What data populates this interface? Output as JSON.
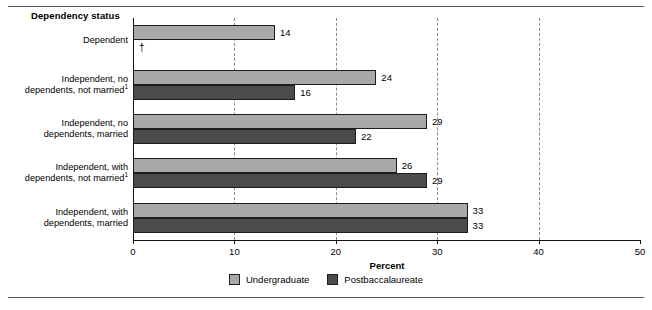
{
  "figure": {
    "group_title": "Dependency status",
    "legend": [
      {
        "label": "Undergraduate",
        "color": "#a8a8a8",
        "key": "undergraduate"
      },
      {
        "label": "Postbaccalaureate",
        "color": "#4b4b4b",
        "key": "postbaccalaureate"
      }
    ],
    "suppressed_symbol": "†"
  },
  "chart_data": {
    "type": "bar",
    "orientation": "horizontal",
    "title": "Dependency status",
    "xlabel": "Percent",
    "ylabel": "",
    "xlim": [
      0,
      50
    ],
    "xticks": [
      0,
      10,
      20,
      30,
      40,
      50
    ],
    "xticklabels": [
      "0",
      "10",
      "20",
      "30",
      "40",
      "50"
    ],
    "grid": "vertical-dashed",
    "legend_position": "bottom-center",
    "categories": [
      "Dependent",
      "Independent, no dependents, not married¹",
      "Independent, no dependents, married",
      "Independent, with dependents, not married¹",
      "Independent, with dependents, married"
    ],
    "category_lines": [
      [
        "Dependent"
      ],
      [
        "Independent, no",
        "dependents, not married"
      ],
      [
        "Independent, no",
        "dependents, married"
      ],
      [
        "Independent, with",
        "dependents, not married"
      ],
      [
        "Independent, with",
        "dependents, married"
      ]
    ],
    "category_footnote_marks": [
      "",
      "1",
      "",
      "1",
      ""
    ],
    "series": [
      {
        "name": "Undergraduate",
        "color": "#a8a8a8",
        "values": [
          14,
          24,
          29,
          26,
          33
        ],
        "labels": [
          "14",
          "24",
          "29",
          "26",
          "33"
        ]
      },
      {
        "name": "Postbaccalaureate",
        "color": "#4b4b4b",
        "values": [
          null,
          16,
          22,
          29,
          33
        ],
        "labels": [
          "†",
          "16",
          "22",
          "29",
          "33"
        ]
      }
    ]
  }
}
